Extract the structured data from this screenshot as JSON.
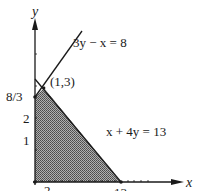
{
  "diagram": {
    "type": "linear-programming-feasible-region",
    "axes": {
      "x_label": "x",
      "y_label": "y",
      "x_ticks": [
        {
          "value": 2,
          "label": "2"
        },
        {
          "value": 13,
          "label": "13"
        }
      ],
      "y_ticks": [
        {
          "value": 1,
          "label": "1"
        },
        {
          "value": 2,
          "label": "2"
        },
        {
          "value": 2.6667,
          "label": "8/3"
        }
      ]
    },
    "lines": [
      {
        "equation": "3y − x = 8",
        "label": "3y − x = 8"
      },
      {
        "equation": "x + 4y = 13",
        "label": "x + 4y = 13"
      }
    ],
    "points": [
      {
        "label": "(1,3)",
        "x": 1,
        "y": 3
      },
      {
        "label": "8/3",
        "x": 0,
        "y": 2.6667
      },
      {
        "label": "13",
        "x": 13,
        "y": 0
      }
    ],
    "region": {
      "description": "shaded feasible region bounded by axes, 3y − x = 8 and x + 4y = 13",
      "vertices": [
        [
          0,
          0
        ],
        [
          0,
          2.6667
        ],
        [
          1,
          3
        ],
        [
          13,
          0
        ]
      ],
      "fill": "#8a8a8a"
    },
    "colors": {
      "ink": "#1a1a1a",
      "shade": "#8a8a8a"
    }
  },
  "labels": {
    "y_axis": "y",
    "x_axis": "x",
    "line1": "3y − x = 8",
    "line2": "x + 4y = 13",
    "point_13": "(1,3)",
    "y_8_3": "8/3",
    "y_2": "2",
    "y_1": "1",
    "x_2": "2",
    "x_13": "13"
  }
}
